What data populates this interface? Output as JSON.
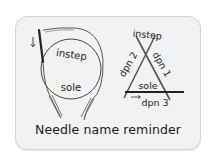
{
  "circular_diagram": {
    "labels": {
      "top": "instep",
      "bottom": "sole"
    },
    "arrow": "down-arrow"
  },
  "dpn_diagram": {
    "labels": {
      "top": "instep",
      "bottom": "sole",
      "right": "dpn 1",
      "left": "dpn 2",
      "base": "dpn 3"
    },
    "arrow": "right-arrow"
  },
  "title": "Needle name reminder",
  "colors": {
    "card_bg": "#f2f2f2",
    "card_border": "#d4d4d4",
    "line": "#444444",
    "needle_dark": "#222222"
  }
}
